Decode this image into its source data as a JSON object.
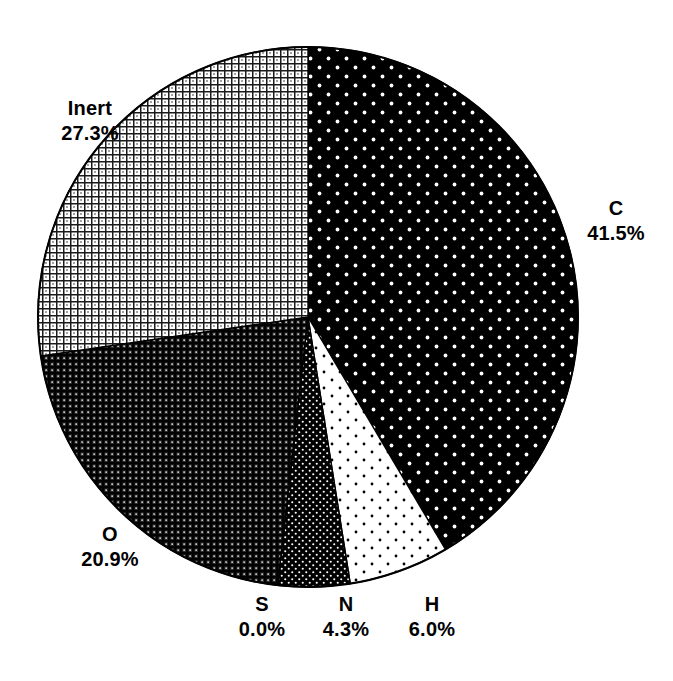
{
  "chart_data": {
    "type": "pie",
    "title": "",
    "subtitle": "",
    "xlabel": "",
    "ylabel": "",
    "legend_position": "none",
    "grid": false,
    "units": "percent",
    "start_angle_deg": 0,
    "direction": "clockwise",
    "categories": [
      "C",
      "H",
      "N",
      "S",
      "O",
      "Inert"
    ],
    "values": [
      41.5,
      6.0,
      4.3,
      0.0,
      20.9,
      27.3
    ],
    "slices": [
      {
        "name": "C",
        "value": 41.5,
        "label": "C",
        "value_label": "41.5%",
        "fill": "black-white-dots",
        "fill_color": "#000000",
        "pattern_color": "#ffffff",
        "start_deg": 0.0,
        "end_deg": 149.4
      },
      {
        "name": "H",
        "value": 6.0,
        "label": "H",
        "value_label": "6.0%",
        "fill": "white-black-dots",
        "fill_color": "#ffffff",
        "pattern_color": "#000000",
        "start_deg": 149.4,
        "end_deg": 171.0
      },
      {
        "name": "N",
        "value": 4.3,
        "label": "N",
        "value_label": "4.3%",
        "fill": "dark-fine-dots",
        "fill_color": "#000000",
        "pattern_color": "#ffffff",
        "start_deg": 171.0,
        "end_deg": 186.48
      },
      {
        "name": "S",
        "value": 0.0,
        "label": "S",
        "value_label": "0.0%",
        "fill": "solid-black-hairline",
        "fill_color": "#000000",
        "pattern_color": "#000000",
        "start_deg": 186.48,
        "end_deg": 186.48
      },
      {
        "name": "O",
        "value": 20.9,
        "label": "O",
        "value_label": "20.9%",
        "fill": "dark-crosshatch",
        "fill_color": "#3a3a3a",
        "pattern_color": "#000000",
        "start_deg": 186.48,
        "end_deg": 261.72
      },
      {
        "name": "Inert",
        "value": 27.3,
        "label": "Inert",
        "value_label": "27.3%",
        "fill": "light-crosshatch",
        "fill_color": "#ffffff",
        "pattern_color": "#000000",
        "start_deg": 261.72,
        "end_deg": 360.0
      }
    ],
    "geometry": {
      "center_x": 308,
      "center_y": 317,
      "radius": 270
    }
  },
  "labels": {
    "inert": {
      "name": "Inert",
      "value": "27.3%"
    },
    "c": {
      "name": "C",
      "value": "41.5%"
    },
    "o": {
      "name": "O",
      "value": "20.9%"
    },
    "s": {
      "name": "S",
      "value": "0.0%"
    },
    "n": {
      "name": "N",
      "value": "4.3%"
    },
    "h": {
      "name": "H",
      "value": "6.0%"
    }
  },
  "title": {
    "text": ""
  },
  "colors": {
    "background": "#ffffff",
    "ink": "#000000",
    "outline": "#000000"
  }
}
